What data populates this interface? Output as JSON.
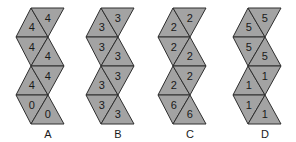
{
  "figure": {
    "nets": [
      {
        "label": "A",
        "offset_x": 0,
        "numbers": [
          "4",
          "4",
          "4",
          "4",
          "4",
          "4",
          "0",
          "0"
        ]
      },
      {
        "label": "B",
        "offset_x": 70,
        "numbers": [
          "3",
          "3",
          "3",
          "3",
          "3",
          "3",
          "3",
          "3"
        ]
      },
      {
        "label": "C",
        "offset_x": 142,
        "numbers": [
          "2",
          "2",
          "2",
          "2",
          "2",
          "2",
          "6",
          "6"
        ]
      },
      {
        "label": "D",
        "offset_x": 217,
        "numbers": [
          "5",
          "5",
          "5",
          "5",
          "1",
          "1",
          "1",
          "1"
        ]
      }
    ],
    "colors": {
      "face": "#a3a3a3",
      "edge": "#2e2e2e",
      "text": "#1a1a1a",
      "background": "#ffffff"
    }
  }
}
